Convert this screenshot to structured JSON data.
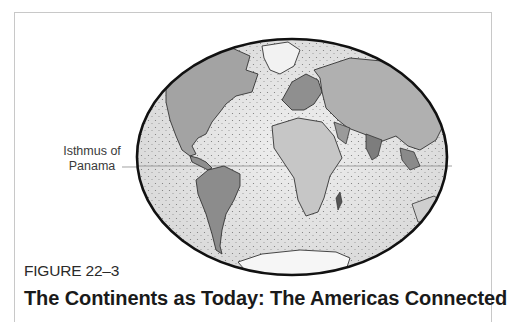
{
  "figure": {
    "number": "FIGURE 22–3",
    "title": "The Continents as Today: The Americas Connected"
  },
  "map": {
    "projection": "elliptical world map",
    "annotations": [
      {
        "label_line1": "Isthmus of",
        "label_line2": "Panama",
        "target": "Central America land bridge"
      }
    ],
    "colors": {
      "outline": "#111111",
      "ocean": "#e6e6e6",
      "land": "#9a9a9a",
      "ice": "#f7f7f7",
      "frame": "#c8c8c8"
    }
  }
}
